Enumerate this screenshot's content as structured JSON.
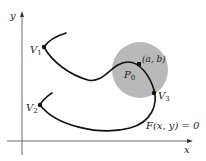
{
  "figure": {
    "axes": {
      "x_label": "x",
      "y_label": "y"
    },
    "points": {
      "v1": {
        "label": "V",
        "sub": "1"
      },
      "v2": {
        "label": "V",
        "sub": "2"
      },
      "v3": {
        "label": "V",
        "sub": "3"
      },
      "p0": {
        "label": "P",
        "sub": "0"
      },
      "ab": {
        "label": "(a, b)"
      }
    },
    "equation": "F(x, y) = 0",
    "colors": {
      "curve": "#111111",
      "disk": "#b8b8b8",
      "axis": "#555555"
    }
  }
}
